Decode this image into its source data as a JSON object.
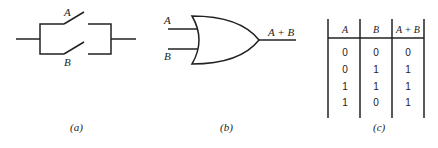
{
  "panel_a": {
    "caption": "(a)",
    "switch_labels": [
      "A",
      "B"
    ]
  },
  "panel_b": {
    "caption": "(b)",
    "inputs": [
      "A",
      "B"
    ],
    "output": "A + B"
  },
  "panel_c": {
    "caption": "(c)",
    "headers": [
      "A",
      "B",
      "A + B"
    ],
    "rows": [
      [
        "0",
        "0",
        "0"
      ],
      [
        "0",
        "1",
        "1"
      ],
      [
        "1",
        "1",
        "1"
      ],
      [
        "1",
        "0",
        "1"
      ]
    ]
  }
}
